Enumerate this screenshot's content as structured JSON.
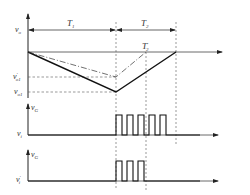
{
  "top_plot": {
    "y_label": "v",
    "y_label_sub": "o",
    "period_1_label": "T",
    "period_1_sub": "1",
    "period_2_label": "T",
    "period_2_sub": "2",
    "period_2_prime_label": "T",
    "period_2_prime_sub": "2",
    "period_2_prime_mark": "′",
    "level_prime_label": "v",
    "level_prime_mark": "′",
    "level_prime_sub": "o1",
    "level_label": "v",
    "level_sub": "o1"
  },
  "pulse_plot_1": {
    "y_label": "v",
    "y_label_sub": "G",
    "x_label": "v",
    "x_label_sub": "i",
    "pulse_count": 5
  },
  "pulse_plot_2": {
    "y_label": "v",
    "y_label_sub": "G",
    "x_label": "v",
    "x_label_mark": "′",
    "x_label_sub": "i",
    "pulse_count": 3
  },
  "colors": {
    "line": "#222222",
    "dashed": "#555555",
    "text": "#333333"
  }
}
